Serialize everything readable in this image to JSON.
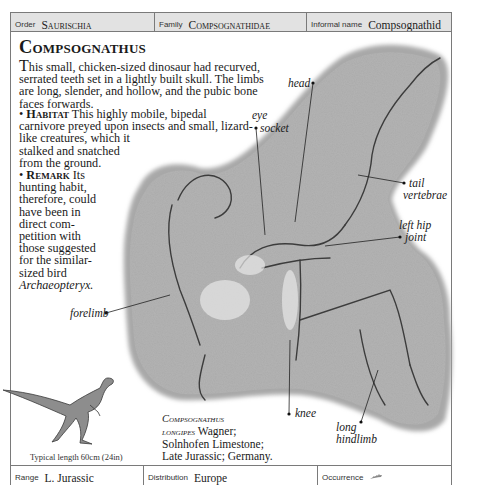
{
  "header": {
    "order": {
      "label": "Order",
      "value": "Saurischia"
    },
    "family": {
      "label": "Family",
      "value": "Compsognathidae"
    },
    "informal_name": {
      "label": "Informal name",
      "value": "Compsognathid"
    }
  },
  "entry": {
    "title": "Compsognathus",
    "intro_dropcap": "T",
    "intro": "his small, chicken-sized dinosaur had recurved, serrated teeth set in a lightly built skull. The limbs are long, slender, and hollow, and the pubic bone faces forwards.",
    "habitat": {
      "bullet": "•",
      "heading": "Habitat",
      "lines": [
        "This highly mobile, bipedal",
        "carnivore preyed upon insects and small, lizard-",
        "like creatures, which it",
        "stalked and snatched",
        "from the ground."
      ]
    },
    "remark": {
      "bullet": "•",
      "heading": "Remark",
      "lines": [
        "Its",
        "hunting habit,",
        "therefore, could",
        "have been in",
        "direct com-",
        "petition with",
        "those suggested",
        "for the similar-",
        "sized bird"
      ],
      "italic_end": "Archaeopteryx."
    }
  },
  "callouts": {
    "head": "head",
    "eye_socket_1": "eye",
    "eye_socket_2": "socket",
    "tail_1": "tail",
    "tail_2": "vertebrae",
    "hip_1": "left hip",
    "hip_2": "joint",
    "forelimb": "forelimb",
    "knee": "knee",
    "hindlimb_1": "long",
    "hindlimb_2": "hindlimb"
  },
  "specimen_caption": {
    "genus": "Compsognathus",
    "species": "longipes",
    "author": "Wagner;",
    "line2": "Solnhofen Limestone;",
    "line3": "Late Jurassic; Germany."
  },
  "reconstruction": {
    "caption": "Typical length 60cm (24in)"
  },
  "footer": {
    "range": {
      "label": "Range",
      "value": "L. Jurassic"
    },
    "distribution": {
      "label": "Distribution",
      "value": "Europe"
    },
    "occurrence": {
      "label": "Occurrence",
      "icon": "fossil-occurrence-icon"
    }
  },
  "colors": {
    "header_bg": "#e2e2e2",
    "border": "#7a7a7a",
    "matrix_rock": "#a9a9a9",
    "text": "#1a1a1a"
  }
}
